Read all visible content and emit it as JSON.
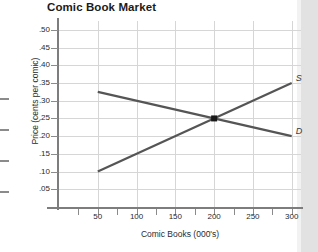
{
  "chart_data": {
    "type": "line",
    "title": "Comic Book Market",
    "xlabel": "Comic Books (000's)",
    "ylabel": "Price (cents per comic)",
    "xlim": [
      0,
      312
    ],
    "ylim": [
      0,
      0.525
    ],
    "grid": true,
    "legend_position": "inline-right",
    "x_ticks": [
      50,
      100,
      150,
      200,
      250,
      300
    ],
    "x_tick_labels": [
      "50",
      "100",
      "150",
      "200",
      "250",
      "300"
    ],
    "x_minor_ticks": [
      25,
      75,
      125,
      175,
      225,
      275
    ],
    "y_ticks": [
      0.05,
      0.1,
      0.15,
      0.2,
      0.25,
      0.3,
      0.35,
      0.4,
      0.45,
      0.5
    ],
    "y_tick_labels": [
      ".05",
      ".10",
      ".15",
      ".20",
      ".25",
      ".30",
      ".35",
      ".40",
      ".45",
      ".50"
    ],
    "series": [
      {
        "name": "S",
        "label": "S",
        "role": "supply",
        "color": "#555555",
        "x": [
          50,
          300
        ],
        "values": [
          0.1,
          0.35
        ]
      },
      {
        "name": "D",
        "label": "D",
        "role": "demand",
        "color": "#555555",
        "x": [
          50,
          300
        ],
        "values": [
          0.325,
          0.2
        ]
      }
    ],
    "annotations": [
      {
        "name": "equilibrium-point",
        "marker": "square",
        "color": "#1a1a1a",
        "x": 200,
        "y": 0.25
      }
    ]
  }
}
